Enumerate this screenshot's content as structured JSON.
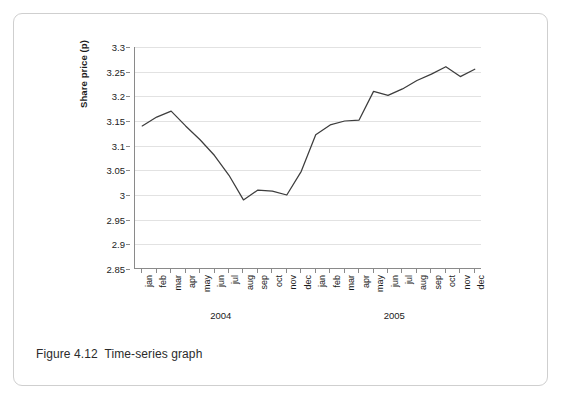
{
  "figure": {
    "caption": "Figure 4.12  Time-series graph",
    "caption_number": "Figure 4.12",
    "caption_text": "Time-series graph"
  },
  "chart_data": {
    "type": "line",
    "title": "",
    "xlabel": "",
    "ylabel": "Share price (p)",
    "ylim": [
      2.85,
      3.3
    ],
    "yticks": [
      "2.85",
      "2.9",
      "2.95",
      "3",
      "3.05",
      "3.1",
      "3.15",
      "3.2",
      "3.25",
      "3.3"
    ],
    "ytick_values": [
      2.85,
      2.9,
      2.95,
      3.0,
      3.05,
      3.1,
      3.15,
      3.2,
      3.25,
      3.3
    ],
    "grid": true,
    "legend": "none",
    "line_color": "#3d3d3d",
    "grid_color": "#e2e2e2",
    "axis_color": "#8a8a8a",
    "categories": [
      "jan",
      "feb",
      "mar",
      "apr",
      "may",
      "jun",
      "jul",
      "aug",
      "sep",
      "oct",
      "nov",
      "dec",
      "jan",
      "feb",
      "mar",
      "apr",
      "may",
      "jun",
      "jul",
      "aug",
      "sep",
      "oct",
      "nov",
      "dec"
    ],
    "groups": [
      {
        "label": "2004",
        "start_index": 0,
        "end_index": 11
      },
      {
        "label": "2005",
        "start_index": 12,
        "end_index": 23
      }
    ],
    "series": [
      {
        "name": "Share price (p)",
        "values": [
          3.14,
          3.158,
          3.17,
          3.14,
          3.112,
          3.08,
          3.04,
          2.99,
          3.01,
          3.008,
          3.0,
          3.048,
          3.122,
          3.142,
          3.15,
          3.152,
          3.21,
          3.202,
          3.215,
          3.232,
          3.245,
          3.26,
          3.24,
          3.255
        ]
      }
    ]
  }
}
